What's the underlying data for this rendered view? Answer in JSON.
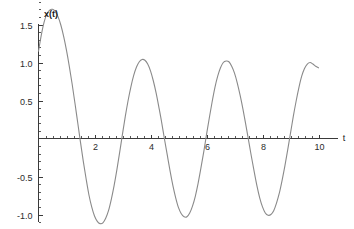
{
  "figure": {
    "background_color": "#ffffff",
    "width": 354,
    "height": 229
  },
  "labels": {
    "y_axis_title": "x(t)",
    "x_axis_title": "t"
  },
  "chart_data": {
    "type": "line",
    "title": "",
    "subtitle": "",
    "xlabel": "t",
    "ylabel": "x(t)",
    "xlim": [
      0,
      10.2
    ],
    "ylim": [
      -1.25,
      1.85
    ],
    "grid": false,
    "legend": null,
    "legend_position": "none",
    "axis_style": "spines-cross-at-origin",
    "x_ticks_major": [
      2,
      4,
      6,
      8,
      10
    ],
    "x_tick_labels": [
      "2",
      "4",
      "6",
      "8",
      "10"
    ],
    "x_ticks_minor_step": 0.25,
    "y_ticks_major": [
      -1.0,
      -0.5,
      0.5,
      1.0,
      1.5
    ],
    "y_tick_labels": [
      "-1.0",
      "-0.5",
      "0.5",
      "1.0",
      "1.5"
    ],
    "y_ticks_minor_step": 0.1,
    "series": [
      {
        "name": "x(t)",
        "color": "#8a8a8a",
        "line_width": 1.1,
        "x": [
          0.0,
          0.1,
          0.2,
          0.3,
          0.4,
          0.5,
          0.6,
          0.7,
          0.8,
          0.9,
          1.0,
          1.1,
          1.2,
          1.3,
          1.4,
          1.5,
          1.6,
          1.7,
          1.8,
          1.9,
          2.0,
          2.1,
          2.2,
          2.3,
          2.4,
          2.5,
          2.6,
          2.7,
          2.8,
          2.9,
          3.0,
          3.1,
          3.2,
          3.3,
          3.4,
          3.5,
          3.6,
          3.7,
          3.8,
          3.9,
          4.0,
          4.1,
          4.2,
          4.3,
          4.4,
          4.5,
          4.6,
          4.7,
          4.8,
          4.9,
          5.0,
          5.1,
          5.2,
          5.3,
          5.4,
          5.5,
          5.6,
          5.7,
          5.8,
          5.9,
          6.0,
          6.1,
          6.2,
          6.3,
          6.4,
          6.5,
          6.6,
          6.7,
          6.8,
          6.9,
          7.0,
          7.1,
          7.2,
          7.3,
          7.4,
          7.5,
          7.6,
          7.7,
          7.8,
          7.9,
          8.0,
          8.1,
          8.2,
          8.3,
          8.4,
          8.5,
          8.6,
          8.7,
          8.8,
          8.9,
          9.0,
          9.1,
          9.2,
          9.3,
          9.4,
          9.5,
          9.6,
          9.7,
          9.8,
          9.9,
          10.0
        ],
        "y": [
          1.15,
          1.36,
          1.53,
          1.64,
          1.69,
          1.7,
          1.67,
          1.6,
          1.49,
          1.34,
          1.16,
          0.95,
          0.72,
          0.47,
          0.21,
          -0.05,
          -0.3,
          -0.53,
          -0.74,
          -0.9,
          -1.02,
          -1.09,
          -1.12,
          -1.11,
          -1.05,
          -0.95,
          -0.8,
          -0.62,
          -0.41,
          -0.18,
          0.06,
          0.29,
          0.5,
          0.68,
          0.83,
          0.94,
          1.01,
          1.04,
          1.03,
          0.98,
          0.89,
          0.76,
          0.6,
          0.41,
          0.21,
          -0.01,
          -0.22,
          -0.43,
          -0.62,
          -0.78,
          -0.91,
          -0.99,
          -1.03,
          -1.03,
          -0.98,
          -0.89,
          -0.76,
          -0.59,
          -0.39,
          -0.18,
          0.05,
          0.27,
          0.48,
          0.67,
          0.82,
          0.93,
          1.0,
          1.02,
          1.01,
          0.95,
          0.86,
          0.73,
          0.57,
          0.39,
          0.19,
          -0.02,
          -0.23,
          -0.43,
          -0.62,
          -0.78,
          -0.9,
          -0.98,
          -1.01,
          -1.0,
          -0.95,
          -0.85,
          -0.72,
          -0.55,
          -0.36,
          -0.15,
          0.07,
          0.29,
          0.49,
          0.67,
          0.82,
          0.92,
          0.98,
          1.0,
          0.98,
          0.95,
          0.93
        ]
      }
    ],
    "annotations": []
  }
}
